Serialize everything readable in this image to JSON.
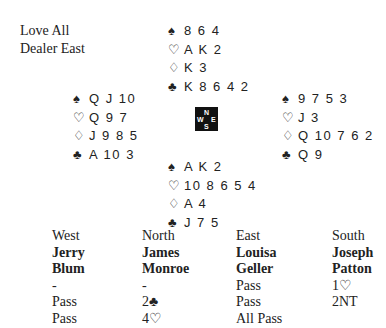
{
  "info": {
    "vulnerability": "Love All",
    "dealer": "Dealer East"
  },
  "suit_symbols": {
    "spades": "♠",
    "hearts": "♡",
    "diamonds": "♢",
    "clubs": "♣"
  },
  "hands": {
    "north": {
      "spades": "8 6 4",
      "hearts": "A K 2",
      "diamonds": "K 3",
      "clubs": "K 8 6 4 2"
    },
    "west": {
      "spades": "Q J 10",
      "hearts": "Q 9 7",
      "diamonds": "J 9 8 5",
      "clubs": "A 10 3"
    },
    "east": {
      "spades": "9 7 5 3",
      "hearts": "J 3",
      "diamonds": "Q 10 7 6 2",
      "clubs": "Q 9"
    },
    "south": {
      "spades": "A K 2",
      "hearts": "10 8 6 5 4",
      "diamonds": "A 4",
      "clubs": "J 7 5"
    }
  },
  "compass": {
    "n": "N",
    "w": "W",
    "e": "E",
    "s": "S"
  },
  "auction": {
    "columns": [
      {
        "seat": "West",
        "first": "Jerry",
        "last": "Blum",
        "bids": [
          "-",
          "Pass",
          "Pass"
        ]
      },
      {
        "seat": "North",
        "first": "James",
        "last": "Monroe",
        "bids": [
          "-",
          "2♣",
          "4♡"
        ]
      },
      {
        "seat": "East",
        "first": "Louisa",
        "last": "Geller",
        "bids": [
          "Pass",
          "Pass",
          "All Pass"
        ]
      },
      {
        "seat": "South",
        "first": "Joseph",
        "last": "Patton",
        "bids": [
          "1♡",
          "2NT",
          ""
        ]
      }
    ]
  }
}
